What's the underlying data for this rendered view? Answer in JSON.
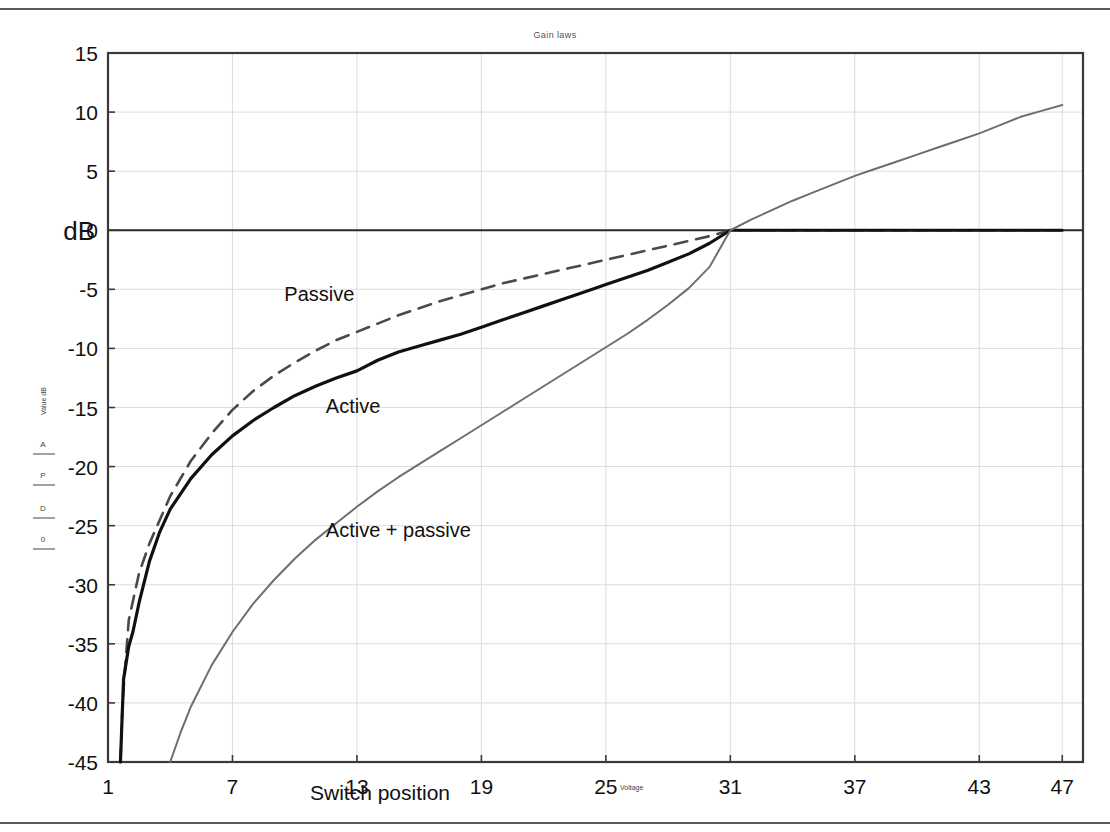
{
  "page": {
    "title": "Gain laws",
    "background": "#ffffff",
    "rule_color": "#5a5a5a"
  },
  "inner_plot": {
    "title": "Gain laws",
    "y_axis_label": "Value dB",
    "x_axis_label": "Voltage",
    "legend_entries": [
      "A",
      "P",
      "D",
      "0"
    ]
  },
  "chart_data": {
    "type": "line",
    "title": "Gain laws",
    "xlabel": "Switch position",
    "ylabel": "dB",
    "xlim": [
      1,
      48
    ],
    "ylim": [
      -45,
      15
    ],
    "xticks": [
      1,
      7,
      13,
      19,
      25,
      31,
      37,
      43,
      47
    ],
    "yticks": [
      15,
      10,
      5,
      0,
      -5,
      -10,
      -15,
      -20,
      -25,
      -30,
      -35,
      -40,
      -45
    ],
    "grid": true,
    "grid_color": "#dcdcdc",
    "legend_position": "inline-annotations",
    "annotations": [
      {
        "text": "Passive",
        "x": 9.5,
        "y": -6.0
      },
      {
        "text": "Active",
        "x": 11.5,
        "y": -15.5
      },
      {
        "text": "Active + passive",
        "x": 11.5,
        "y": -26.0
      }
    ],
    "series": [
      {
        "name": "Passive",
        "color": "#4a4a4a",
        "style": "dashed",
        "width": 2.6,
        "x": [
          1.6,
          1.7,
          2.0,
          2.5,
          3.0,
          4.0,
          5.0,
          6.0,
          7.0,
          8.0,
          9.0,
          10.0,
          11.0,
          12.0,
          13.0,
          14.0,
          15.0,
          16.0,
          17.0,
          18.0,
          19.0,
          20.0,
          21.0,
          22.0,
          23.0,
          24.0,
          25.0,
          26.0,
          27.0,
          28.0,
          29.0,
          30.0,
          31.0,
          33.0,
          37.0,
          41.0,
          45.0,
          47.0
        ],
        "y": [
          -45.0,
          -40.0,
          -33.0,
          -29.0,
          -26.5,
          -22.5,
          -19.5,
          -17.2,
          -15.2,
          -13.6,
          -12.3,
          -11.2,
          -10.2,
          -9.3,
          -8.6,
          -7.9,
          -7.2,
          -6.6,
          -6.0,
          -5.5,
          -5.0,
          -4.5,
          -4.1,
          -3.7,
          -3.3,
          -2.9,
          -2.5,
          -2.1,
          -1.7,
          -1.3,
          -0.9,
          -0.5,
          0.0,
          0.0,
          0.0,
          0.0,
          0.0,
          0.0
        ]
      },
      {
        "name": "Active",
        "color": "#111111",
        "style": "solid",
        "width": 3.2,
        "x": [
          1.6,
          1.75,
          2.0,
          2.2,
          2.5,
          3.0,
          3.5,
          4.0,
          5.0,
          6.0,
          7.0,
          8.0,
          9.0,
          10.0,
          11.0,
          12.0,
          13.0,
          14.0,
          15.0,
          16.0,
          17.0,
          18.0,
          19.0,
          20.0,
          21.0,
          22.0,
          23.0,
          24.0,
          25.0,
          26.0,
          27.0,
          28.0,
          29.0,
          30.0,
          31.0,
          33.0,
          37.0,
          41.0,
          45.0,
          47.0
        ],
        "y": [
          -45.0,
          -38.0,
          -35.2,
          -34.0,
          -31.5,
          -28.0,
          -25.5,
          -23.6,
          -21.0,
          -19.0,
          -17.4,
          -16.1,
          -15.0,
          -14.0,
          -13.2,
          -12.5,
          -11.9,
          -11.0,
          -10.3,
          -9.8,
          -9.3,
          -8.8,
          -8.2,
          -7.6,
          -7.0,
          -6.4,
          -5.8,
          -5.2,
          -4.6,
          -4.0,
          -3.4,
          -2.7,
          -2.0,
          -1.1,
          0.0,
          0.0,
          0.0,
          0.0,
          0.0,
          0.0
        ]
      },
      {
        "name": "Active + passive",
        "color": "#6e6e6e",
        "style": "solid",
        "width": 2.0,
        "x": [
          4.0,
          4.5,
          5.0,
          6.0,
          7.0,
          8.0,
          9.0,
          10.0,
          11.0,
          12.0,
          13.0,
          14.0,
          15.0,
          16.0,
          17.0,
          18.0,
          19.0,
          20.0,
          21.0,
          22.0,
          23.0,
          24.0,
          25.0,
          26.0,
          27.0,
          28.0,
          29.0,
          30.0,
          31.0,
          32.0,
          33.0,
          34.0,
          35.0,
          36.0,
          37.0,
          38.0,
          39.0,
          40.0,
          41.0,
          42.0,
          43.0,
          44.0,
          45.0,
          46.0,
          47.0
        ],
        "y": [
          -45.0,
          -42.5,
          -40.3,
          -36.8,
          -34.0,
          -31.6,
          -29.6,
          -27.8,
          -26.2,
          -24.8,
          -23.4,
          -22.1,
          -20.9,
          -19.8,
          -18.7,
          -17.6,
          -16.5,
          -15.4,
          -14.3,
          -13.2,
          -12.1,
          -11.0,
          -9.9,
          -8.8,
          -7.6,
          -6.3,
          -4.9,
          -3.1,
          0.0,
          0.9,
          1.7,
          2.5,
          3.2,
          3.9,
          4.6,
          5.2,
          5.8,
          6.4,
          7.0,
          7.6,
          8.2,
          8.9,
          9.6,
          10.1,
          10.6
        ]
      }
    ]
  }
}
